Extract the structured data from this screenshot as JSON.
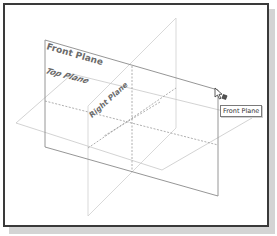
{
  "viewport": {
    "planes": [
      {
        "id": "front",
        "label": "Front Plane"
      },
      {
        "id": "top",
        "label": "Top Plane"
      },
      {
        "id": "right",
        "label": "Right Plane"
      }
    ],
    "tooltip": {
      "text": "Front Plane"
    },
    "cursor": {
      "icon": "select-plane-cursor-icon"
    }
  },
  "colors": {
    "frame_border": "#3a3a3a",
    "front_plane_edge": "#8a8a8a",
    "other_plane_edge": "#c8c8c8",
    "dashed_axis": "#9a9a9a",
    "label": "#6b6b6b"
  }
}
